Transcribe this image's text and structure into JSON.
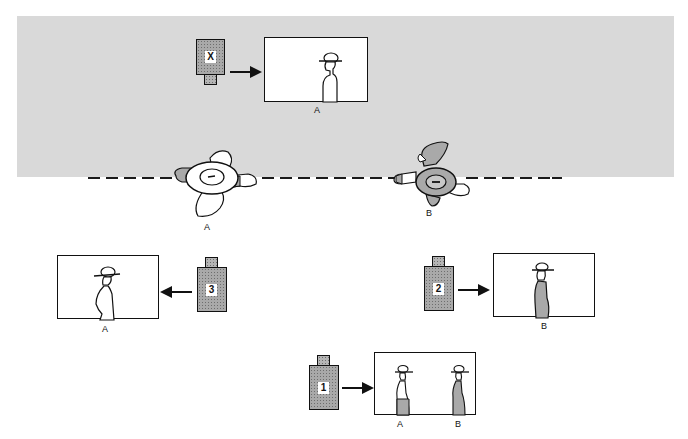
{
  "diagram": {
    "colors": {
      "background": "#ffffff",
      "band": "#d9d9d9",
      "camera_fill": "#a9a9a9",
      "line": "#111111"
    },
    "axis_line": {
      "style": "dashed"
    },
    "actors": [
      {
        "id": "A",
        "label": "A"
      },
      {
        "id": "B",
        "label": "B"
      }
    ],
    "cameras": [
      {
        "id": "X",
        "label": "X",
        "direction": "right",
        "frame_subjects": [
          "A"
        ],
        "frame_labels": [
          "A"
        ]
      },
      {
        "id": "3",
        "label": "3",
        "direction": "left",
        "frame_subjects": [
          "A"
        ],
        "frame_labels": [
          "A"
        ]
      },
      {
        "id": "2",
        "label": "2",
        "direction": "right",
        "frame_subjects": [
          "B"
        ],
        "frame_labels": [
          "B"
        ]
      },
      {
        "id": "1",
        "label": "1",
        "direction": "right",
        "frame_subjects": [
          "A",
          "B"
        ],
        "frame_labels": [
          "A",
          "B"
        ]
      }
    ]
  }
}
